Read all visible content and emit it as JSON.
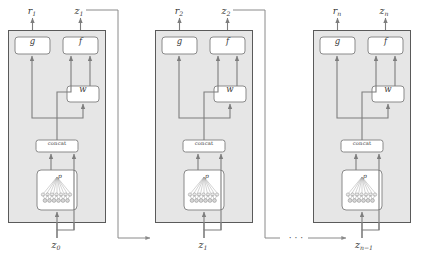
{
  "figure": {
    "background": "#ffffff",
    "panel_fill": "#e6e6e6",
    "panel_stroke": "#5a5a5a",
    "node_fill": "#ffffff",
    "node_stroke": "#8a8a8a",
    "wire_color": "#7d7d7d"
  },
  "blocks": [
    {
      "id": "block-1",
      "output_r": "r",
      "output_r_sub": "1",
      "output_z": "z",
      "output_z_sub": "1",
      "input_z": "z",
      "input_z_sub": "0",
      "nodes": {
        "g": "g",
        "f": "f",
        "w": "w",
        "concat": "concat",
        "p": "p"
      }
    },
    {
      "id": "block-2",
      "output_r": "r",
      "output_r_sub": "2",
      "output_z": "z",
      "output_z_sub": "2",
      "input_z": "z",
      "input_z_sub": "1",
      "nodes": {
        "g": "g",
        "f": "f",
        "w": "w",
        "concat": "concat",
        "p": "p"
      }
    },
    {
      "id": "block-n",
      "output_r": "r",
      "output_r_sub": "n",
      "output_z": "z",
      "output_z_sub": "n",
      "input_z": "z",
      "input_z_sub": "n−1",
      "nodes": {
        "g": "g",
        "f": "f",
        "w": "w",
        "concat": "concat",
        "p": "p"
      }
    }
  ],
  "ellipsis": "· · ·"
}
